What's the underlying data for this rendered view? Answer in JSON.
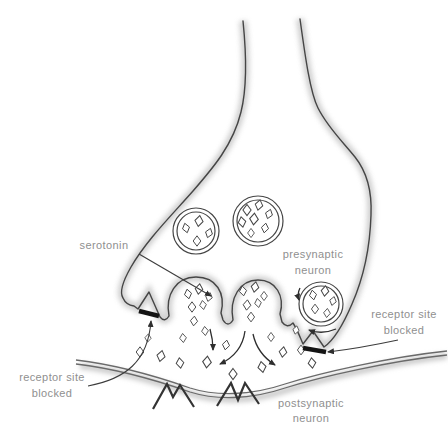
{
  "diagram": {
    "type": "biology-synapse",
    "labels": {
      "serotonin": "serotonin",
      "presynaptic_1": "presynaptic",
      "presynaptic_2": "neuron",
      "postsynaptic_1": "postsynaptic",
      "postsynaptic_2": "neuron",
      "blocked_left_1": "receptor site",
      "blocked_left_2": "blocked",
      "blocked_right_1": "receptor site",
      "blocked_right_2": "blocked"
    },
    "counts": {
      "vesicles": 3,
      "release_cups": 2,
      "blocked_receptor_sites": 2,
      "postsynaptic_receptor_zigzags": 2
    },
    "colors": {
      "outline": "#454545",
      "shading": "#c9c9c9",
      "label_text": "#8f8f8f",
      "blocker_bar": "#141414",
      "background": "#ffffff"
    }
  }
}
